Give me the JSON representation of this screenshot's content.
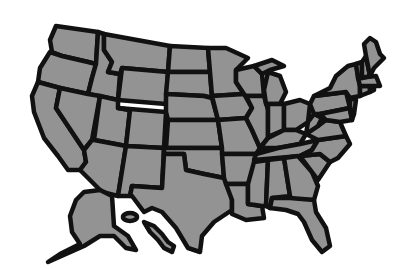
{
  "map": {
    "title": "United States map",
    "fill_color": "#939393",
    "border_color": "#111111",
    "background": "#ffffff",
    "regions": [
      "Washington",
      "Oregon",
      "California",
      "Idaho",
      "Nevada",
      "Montana",
      "Wyoming",
      "Utah",
      "Arizona",
      "Colorado",
      "New Mexico",
      "North Dakota",
      "South Dakota",
      "Nebraska",
      "Kansas",
      "Oklahoma",
      "Texas",
      "Minnesota",
      "Iowa",
      "Missouri",
      "Arkansas",
      "Louisiana",
      "Wisconsin",
      "Illinois",
      "Michigan",
      "Indiana",
      "Ohio",
      "Kentucky",
      "Tennessee",
      "Mississippi",
      "Alabama",
      "Georgia",
      "Florida",
      "South Carolina",
      "North Carolina",
      "Virginia",
      "West Virginia",
      "Pennsylvania",
      "New York",
      "Maryland",
      "New Jersey",
      "Delaware",
      "Connecticut",
      "Rhode Island",
      "Massachusetts",
      "Vermont",
      "New Hampshire",
      "Maine",
      "Alaska",
      "Hawaii"
    ]
  }
}
